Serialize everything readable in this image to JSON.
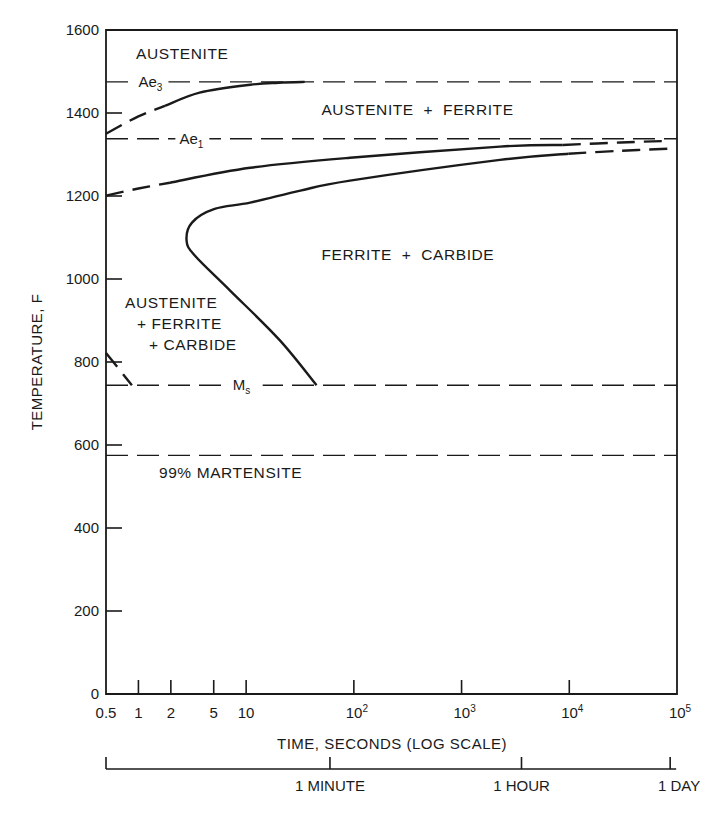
{
  "chart_data": {
    "type": "line",
    "title": "",
    "xlabel": "TIME, SECONDS (LOG SCALE)",
    "ylabel": "TEMPERATURE, F",
    "xscale": "log",
    "xlim": [
      0.5,
      100000
    ],
    "ylim": [
      0,
      1600
    ],
    "grid": false,
    "x_ticks": [
      {
        "value": 0.5,
        "label": "0.5"
      },
      {
        "value": 1,
        "label": "1"
      },
      {
        "value": 2,
        "label": "2"
      },
      {
        "value": 5,
        "label": "5"
      },
      {
        "value": 10,
        "label": "10"
      },
      {
        "value": 100,
        "label": "10",
        "sup": "2"
      },
      {
        "value": 1000,
        "label": "10",
        "sup": "3"
      },
      {
        "value": 10000,
        "label": "10",
        "sup": "4"
      },
      {
        "value": 100000,
        "label": "10",
        "sup": "5"
      }
    ],
    "y_ticks": [
      {
        "value": 0,
        "label": "0"
      },
      {
        "value": 200,
        "label": "200"
      },
      {
        "value": 400,
        "label": "400"
      },
      {
        "value": 600,
        "label": "600"
      },
      {
        "value": 800,
        "label": "800"
      },
      {
        "value": 1000,
        "label": "1000"
      },
      {
        "value": 1200,
        "label": "1200"
      },
      {
        "value": 1400,
        "label": "1400"
      },
      {
        "value": 1600,
        "label": "1600"
      }
    ],
    "secondary_time_axis": [
      {
        "value": 0.5,
        "label": ""
      },
      {
        "value": 60,
        "label": "1 MINUTE"
      },
      {
        "value": 3600,
        "label": "1 HOUR"
      },
      {
        "value": 86400,
        "label": "1 DAY"
      }
    ],
    "reference_lines": [
      {
        "name": "Ae3",
        "label": "Ae",
        "sub": "3",
        "temperature": 1475,
        "label_time": 1.0
      },
      {
        "name": "Ae1",
        "label": "Ae",
        "sub": "1",
        "temperature": 1338,
        "label_time": 2.4
      },
      {
        "name": "Ms",
        "label": "M",
        "sub": "s",
        "temperature": 744,
        "label_time": 7.5
      },
      {
        "name": "M99",
        "label": "",
        "sub": "",
        "temperature": 575,
        "label_time": 0
      }
    ],
    "series": [
      {
        "name": "ferrite-start",
        "segments": [
          {
            "style": "dashed",
            "points": [
              [
                0.5,
                1350
              ],
              [
                1.0,
                1392
              ],
              [
                1.77,
                1417
              ]
            ]
          },
          {
            "style": "solid",
            "points": [
              [
                1.77,
                1417
              ],
              [
                3.7,
                1449
              ],
              [
                10.9,
                1468
              ],
              [
                20,
                1473
              ],
              [
                35,
                1475
              ]
            ]
          }
        ]
      },
      {
        "name": "pearlite-start",
        "segments": [
          {
            "style": "dashed",
            "points": [
              [
                0.5,
                1201
              ],
              [
                1.0,
                1218
              ],
              [
                1.96,
                1232
              ]
            ]
          },
          {
            "style": "solid",
            "points": [
              [
                1.96,
                1232
              ],
              [
                10.9,
                1268
              ],
              [
                92,
                1292
              ],
              [
                2275,
                1319
              ],
              [
                8700,
                1323
              ]
            ]
          },
          {
            "style": "dashed",
            "points": [
              [
                8700,
                1323
              ],
              [
                30000,
                1329
              ],
              [
                86000,
                1333
              ]
            ]
          }
        ]
      },
      {
        "name": "pearlite-finish",
        "segments": [
          {
            "style": "solid",
            "points": [
              [
                45,
                744
              ],
              [
                20.6,
                852
              ],
              [
                7.1,
                972
              ],
              [
                3.35,
                1056
              ],
              [
                2.8,
                1092
              ],
              [
                3.14,
                1136
              ],
              [
                5.1,
                1169
              ],
              [
                10.9,
                1184
              ],
              [
                31.9,
                1213
              ],
              [
                92,
                1237
              ],
              [
                2275,
                1287
              ],
              [
                9800,
                1302
              ]
            ]
          },
          {
            "style": "dashed",
            "points": [
              [
                9800,
                1302
              ],
              [
                30000,
                1309
              ],
              [
                86000,
                1314
              ]
            ]
          }
        ]
      },
      {
        "name": "bainite-start-left",
        "segments": [
          {
            "style": "dashed",
            "points": [
              [
                0.5,
                822
              ],
              [
                0.87,
                744
              ]
            ]
          }
        ]
      }
    ],
    "annotations": [
      {
        "name": "austenite",
        "lines": [
          "AUSTENITE"
        ],
        "time": 0.95,
        "temperature": 1530
      },
      {
        "name": "austenite-ferrite",
        "lines": [
          "AUSTENITE  +  FERRITE"
        ],
        "time": 50,
        "temperature": 1395
      },
      {
        "name": "ferrite-carbide",
        "lines": [
          "FERRITE  +  CARBIDE"
        ],
        "time": 50,
        "temperature": 1045
      },
      {
        "name": "austenite-ferrite-carbide",
        "lines": [
          "AUSTENITE",
          "+ FERRITE",
          "+ CARBIDE"
        ],
        "time": 0.75,
        "temperature": 930
      },
      {
        "name": "martensite-99",
        "lines": [
          "99% MARTENSITE"
        ],
        "time": 1.55,
        "temperature": 520
      }
    ]
  }
}
